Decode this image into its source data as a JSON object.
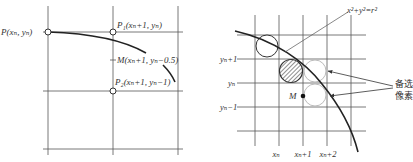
{
  "left_diagram": {
    "points": {
      "P": "P(xₙ, yₙ)",
      "P1": "P₁(xₙ+1, yₙ)",
      "M": "M(xₙ+1, yₙ−0.5)",
      "P2": "P₂(xₙ+1, yₙ−1)"
    }
  },
  "right_diagram": {
    "equation": "x²+y²=r²",
    "y_labels": [
      "yₙ+1",
      "yₙ",
      "yₙ−1"
    ],
    "x_labels": [
      "xₙ",
      "xₙ+1",
      "xₙ+2"
    ],
    "midpoint_label": "M",
    "callout_line1": "备选",
    "callout_line2": "像素"
  },
  "colors": {
    "line": "#333333",
    "grid": "#555555",
    "candidate_circle": "#bbbbbb"
  }
}
